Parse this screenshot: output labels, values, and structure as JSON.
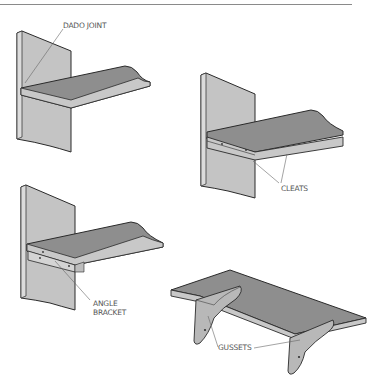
{
  "figure": {
    "type": "shelf support methods illustration",
    "panels": [
      {
        "id": "dado",
        "label": "DADO JOINT"
      },
      {
        "id": "cleats",
        "label": "CLEATS"
      },
      {
        "id": "angle-bracket",
        "label_line1": "ANGLE",
        "label_line2": "BRACKET"
      },
      {
        "id": "gussets",
        "label": "GUSSETS"
      }
    ]
  },
  "colors": {
    "upright": "#c4c4c4",
    "upright_edge": "#dcdcdc",
    "shelf_top": "#8e8e8e",
    "shelf_edge": "#c8c8c8",
    "outline": "#2a2a2a",
    "leader": "#666666",
    "rule": "#8a8a8a"
  }
}
